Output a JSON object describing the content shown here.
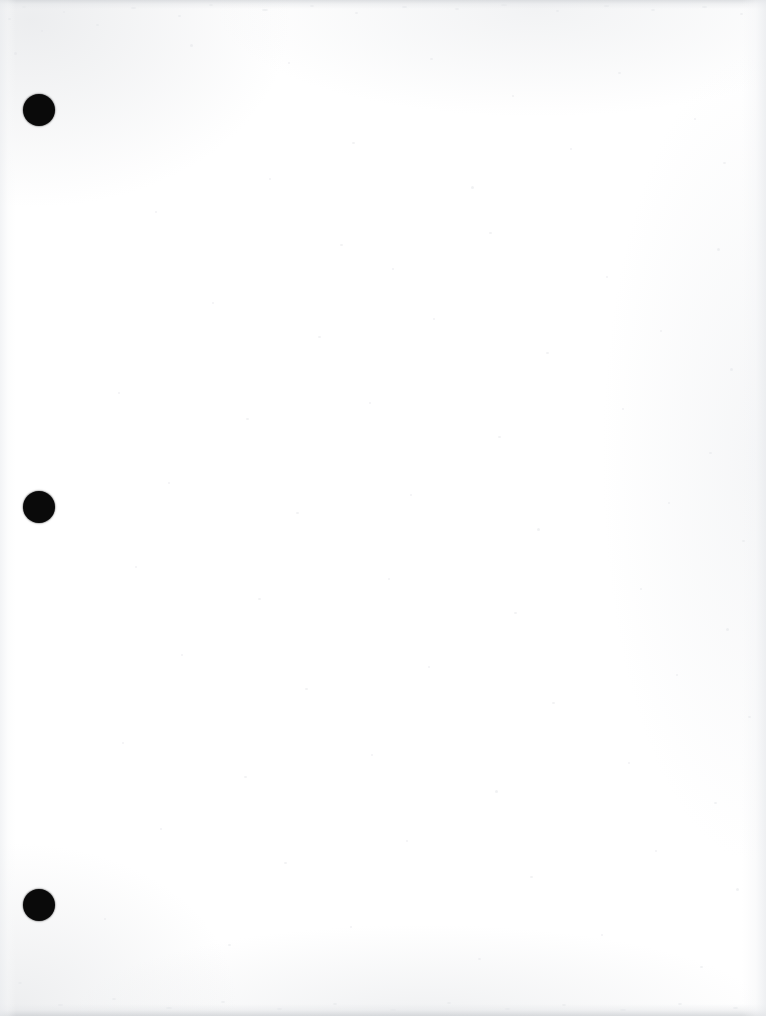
{
  "document": {
    "kind": "scanned-blank-page",
    "page_width": 766,
    "page_height": 1016,
    "background_color": "#ffffff",
    "text_content": "",
    "visible_text_count": 0
  },
  "punch_holes": {
    "label": "three-ring binder punch holes",
    "count": 3,
    "color": "#0a0a0a",
    "diameter": 32,
    "items": [
      {
        "name": "punch-hole-top",
        "cx": 39,
        "cy": 110,
        "d": 32
      },
      {
        "name": "punch-hole-middle",
        "cx": 39,
        "cy": 507,
        "d": 32
      },
      {
        "name": "punch-hole-bottom",
        "cx": 39,
        "cy": 905,
        "d": 32
      }
    ]
  },
  "scan_artifacts": {
    "edge_band_color": "#cbced2",
    "speckle_color": "#e3e5e8",
    "bands": [
      {
        "name": "scan-band-top",
        "edge": "top",
        "thickness": 9
      },
      {
        "name": "scan-band-bottom",
        "edge": "bottom",
        "thickness": 12
      },
      {
        "name": "scan-band-left",
        "edge": "left",
        "thickness": 16
      },
      {
        "name": "scan-band-right",
        "edge": "right",
        "thickness": 24
      }
    ],
    "speckles": [
      {
        "x": 8,
        "y": 18,
        "w": 3,
        "h": 2
      },
      {
        "x": 22,
        "y": 6,
        "w": 4,
        "h": 2
      },
      {
        "x": 41,
        "y": 30,
        "w": 2,
        "h": 2
      },
      {
        "x": 14,
        "y": 52,
        "w": 3,
        "h": 3
      },
      {
        "x": 63,
        "y": 11,
        "w": 2,
        "h": 2
      },
      {
        "x": 96,
        "y": 24,
        "w": 3,
        "h": 2
      },
      {
        "x": 131,
        "y": 7,
        "w": 5,
        "h": 2
      },
      {
        "x": 178,
        "y": 15,
        "w": 3,
        "h": 2
      },
      {
        "x": 209,
        "y": 4,
        "w": 4,
        "h": 2
      },
      {
        "x": 262,
        "y": 9,
        "w": 6,
        "h": 2
      },
      {
        "x": 310,
        "y": 5,
        "w": 4,
        "h": 2
      },
      {
        "x": 355,
        "y": 12,
        "w": 3,
        "h": 2
      },
      {
        "x": 402,
        "y": 6,
        "w": 5,
        "h": 2
      },
      {
        "x": 455,
        "y": 8,
        "w": 4,
        "h": 2
      },
      {
        "x": 501,
        "y": 4,
        "w": 6,
        "h": 2
      },
      {
        "x": 556,
        "y": 10,
        "w": 3,
        "h": 2
      },
      {
        "x": 604,
        "y": 5,
        "w": 5,
        "h": 2
      },
      {
        "x": 651,
        "y": 9,
        "w": 4,
        "h": 2
      },
      {
        "x": 702,
        "y": 6,
        "w": 5,
        "h": 2
      },
      {
        "x": 740,
        "y": 13,
        "w": 3,
        "h": 2
      },
      {
        "x": 190,
        "y": 44,
        "w": 3,
        "h": 3
      },
      {
        "x": 288,
        "y": 62,
        "w": 2,
        "h": 2
      },
      {
        "x": 430,
        "y": 58,
        "w": 3,
        "h": 2
      },
      {
        "x": 512,
        "y": 95,
        "w": 2,
        "h": 2
      },
      {
        "x": 618,
        "y": 72,
        "w": 3,
        "h": 2
      },
      {
        "x": 694,
        "y": 118,
        "w": 2,
        "h": 2
      },
      {
        "x": 352,
        "y": 142,
        "w": 3,
        "h": 2
      },
      {
        "x": 269,
        "y": 178,
        "w": 2,
        "h": 2
      },
      {
        "x": 471,
        "y": 186,
        "w": 3,
        "h": 3
      },
      {
        "x": 570,
        "y": 148,
        "w": 2,
        "h": 2
      },
      {
        "x": 723,
        "y": 162,
        "w": 3,
        "h": 2
      },
      {
        "x": 155,
        "y": 211,
        "w": 2,
        "h": 2
      },
      {
        "x": 340,
        "y": 244,
        "w": 3,
        "h": 2
      },
      {
        "x": 392,
        "y": 268,
        "w": 2,
        "h": 2
      },
      {
        "x": 489,
        "y": 232,
        "w": 3,
        "h": 2
      },
      {
        "x": 606,
        "y": 276,
        "w": 2,
        "h": 2
      },
      {
        "x": 717,
        "y": 248,
        "w": 3,
        "h": 3
      },
      {
        "x": 212,
        "y": 302,
        "w": 2,
        "h": 2
      },
      {
        "x": 318,
        "y": 336,
        "w": 3,
        "h": 2
      },
      {
        "x": 433,
        "y": 318,
        "w": 2,
        "h": 2
      },
      {
        "x": 546,
        "y": 352,
        "w": 3,
        "h": 2
      },
      {
        "x": 660,
        "y": 330,
        "w": 2,
        "h": 2
      },
      {
        "x": 730,
        "y": 368,
        "w": 3,
        "h": 3
      },
      {
        "x": 118,
        "y": 392,
        "w": 2,
        "h": 2
      },
      {
        "x": 246,
        "y": 418,
        "w": 3,
        "h": 2
      },
      {
        "x": 369,
        "y": 402,
        "w": 2,
        "h": 2
      },
      {
        "x": 498,
        "y": 436,
        "w": 3,
        "h": 2
      },
      {
        "x": 622,
        "y": 408,
        "w": 2,
        "h": 2
      },
      {
        "x": 709,
        "y": 452,
        "w": 3,
        "h": 2
      },
      {
        "x": 168,
        "y": 482,
        "w": 2,
        "h": 2
      },
      {
        "x": 296,
        "y": 512,
        "w": 3,
        "h": 2
      },
      {
        "x": 410,
        "y": 494,
        "w": 2,
        "h": 2
      },
      {
        "x": 537,
        "y": 528,
        "w": 3,
        "h": 3
      },
      {
        "x": 668,
        "y": 502,
        "w": 2,
        "h": 2
      },
      {
        "x": 742,
        "y": 540,
        "w": 3,
        "h": 2
      },
      {
        "x": 135,
        "y": 566,
        "w": 2,
        "h": 2
      },
      {
        "x": 258,
        "y": 598,
        "w": 3,
        "h": 2
      },
      {
        "x": 388,
        "y": 578,
        "w": 2,
        "h": 2
      },
      {
        "x": 514,
        "y": 612,
        "w": 3,
        "h": 2
      },
      {
        "x": 640,
        "y": 588,
        "w": 2,
        "h": 2
      },
      {
        "x": 726,
        "y": 628,
        "w": 3,
        "h": 3
      },
      {
        "x": 181,
        "y": 654,
        "w": 2,
        "h": 2
      },
      {
        "x": 305,
        "y": 688,
        "w": 3,
        "h": 2
      },
      {
        "x": 428,
        "y": 666,
        "w": 2,
        "h": 2
      },
      {
        "x": 552,
        "y": 702,
        "w": 3,
        "h": 2
      },
      {
        "x": 676,
        "y": 674,
        "w": 2,
        "h": 2
      },
      {
        "x": 748,
        "y": 716,
        "w": 3,
        "h": 2
      },
      {
        "x": 122,
        "y": 742,
        "w": 2,
        "h": 2
      },
      {
        "x": 244,
        "y": 776,
        "w": 3,
        "h": 2
      },
      {
        "x": 371,
        "y": 754,
        "w": 2,
        "h": 2
      },
      {
        "x": 495,
        "y": 790,
        "w": 3,
        "h": 3
      },
      {
        "x": 628,
        "y": 762,
        "w": 2,
        "h": 2
      },
      {
        "x": 714,
        "y": 802,
        "w": 3,
        "h": 2
      },
      {
        "x": 160,
        "y": 828,
        "w": 2,
        "h": 2
      },
      {
        "x": 284,
        "y": 862,
        "w": 3,
        "h": 2
      },
      {
        "x": 406,
        "y": 840,
        "w": 2,
        "h": 2
      },
      {
        "x": 530,
        "y": 876,
        "w": 3,
        "h": 2
      },
      {
        "x": 655,
        "y": 850,
        "w": 2,
        "h": 2
      },
      {
        "x": 736,
        "y": 888,
        "w": 3,
        "h": 3
      },
      {
        "x": 104,
        "y": 918,
        "w": 2,
        "h": 2
      },
      {
        "x": 228,
        "y": 944,
        "w": 3,
        "h": 2
      },
      {
        "x": 350,
        "y": 926,
        "w": 2,
        "h": 2
      },
      {
        "x": 478,
        "y": 958,
        "w": 3,
        "h": 2
      },
      {
        "x": 601,
        "y": 934,
        "w": 2,
        "h": 2
      },
      {
        "x": 700,
        "y": 966,
        "w": 3,
        "h": 2
      },
      {
        "x": 18,
        "y": 982,
        "w": 4,
        "h": 2
      },
      {
        "x": 58,
        "y": 1004,
        "w": 5,
        "h": 2
      },
      {
        "x": 112,
        "y": 998,
        "w": 4,
        "h": 2
      },
      {
        "x": 166,
        "y": 1007,
        "w": 6,
        "h": 2
      },
      {
        "x": 221,
        "y": 1001,
        "w": 4,
        "h": 2
      },
      {
        "x": 277,
        "y": 1008,
        "w": 5,
        "h": 2
      },
      {
        "x": 333,
        "y": 1003,
        "w": 4,
        "h": 2
      },
      {
        "x": 390,
        "y": 1009,
        "w": 6,
        "h": 2
      },
      {
        "x": 447,
        "y": 1002,
        "w": 4,
        "h": 2
      },
      {
        "x": 505,
        "y": 1008,
        "w": 5,
        "h": 2
      },
      {
        "x": 562,
        "y": 1004,
        "w": 4,
        "h": 2
      },
      {
        "x": 620,
        "y": 1009,
        "w": 6,
        "h": 2
      },
      {
        "x": 678,
        "y": 1003,
        "w": 4,
        "h": 2
      },
      {
        "x": 733,
        "y": 1007,
        "w": 5,
        "h": 2
      }
    ]
  }
}
